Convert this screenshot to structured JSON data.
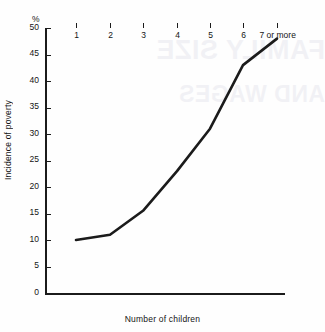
{
  "chart_data": {
    "type": "line",
    "title": "",
    "subtitle": "",
    "xlabel": "Number of children",
    "ylabel": "Incidence of poverty",
    "y_unit_label": "%",
    "categories": [
      "1",
      "2",
      "3",
      "4",
      "5",
      "6",
      "7 or more"
    ],
    "values": [
      10,
      11,
      15.5,
      23,
      31,
      43,
      48
    ],
    "series": [
      {
        "name": "Incidence of poverty",
        "values": [
          10,
          11,
          15.5,
          23,
          31,
          43,
          48
        ],
        "color": "#1b1b1b"
      }
    ],
    "ylim": [
      0,
      50
    ],
    "yticks": [
      0,
      5,
      10,
      15,
      20,
      25,
      30,
      35,
      40,
      45,
      50
    ],
    "ytick_labels": [
      "0",
      "5",
      "10",
      "15",
      "20",
      "25",
      "30",
      "35",
      "40",
      "45",
      "50"
    ],
    "xtick_labels": [
      "1",
      "2",
      "3",
      "4",
      "5",
      "6",
      "7 or more"
    ],
    "grid": false,
    "legend": false,
    "legend_position": "none",
    "annotations": []
  },
  "watermark": {
    "line1": "FAMILY SIZE",
    "line2": "AND WAGES"
  },
  "colors": {
    "axis": "#1b1b1b",
    "line": "#1b1b1b",
    "background": "#fefefe",
    "text": "#141414"
  }
}
